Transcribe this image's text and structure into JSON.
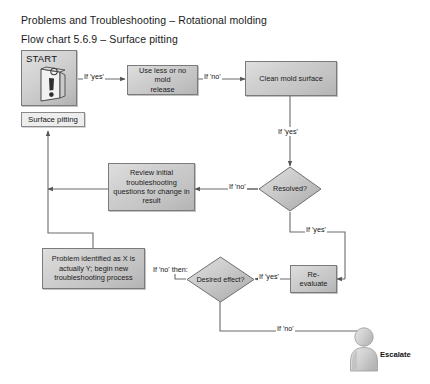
{
  "document": {
    "title_main": "Problems and Troubleshooting – Rotational molding",
    "title_sub": "Flow chart 5.6.9 – Surface pitting"
  },
  "colors": {
    "page_background": "#ffffff",
    "node_fill_light": "#dedede",
    "node_fill_dark": "#b4b4b4",
    "node_border": "#7b7b7b",
    "connector": "#6b6b6b",
    "text": "#1c1c1c",
    "label_box_fill": "#ededed"
  },
  "nodes": {
    "start": {
      "label": "START",
      "icon": "warning-document-icon",
      "shape": "start-box"
    },
    "surface_pitting": {
      "label": "Surface pitting",
      "shape": "label-box"
    },
    "use_less_release": {
      "label": "Use less or no mold release",
      "lines": [
        "Use less or no mold",
        "release"
      ],
      "shape": "process"
    },
    "clean_mold_surface": {
      "label": "Clean mold surface",
      "lines": [
        "Clean mold surface"
      ],
      "shape": "process"
    },
    "resolved": {
      "label": "Resolved?",
      "lines": [
        "Resolved?"
      ],
      "shape": "decision"
    },
    "review_initial": {
      "label": "Review initial troubleshooting questions for change in result",
      "lines": [
        "Review initial",
        "troubleshooting",
        "questions for change in",
        "result"
      ],
      "shape": "process"
    },
    "problem_identified": {
      "label": "Problem identified as X is actually Y; begin new troubleshooting process",
      "lines": [
        "Problem identified as X is",
        "actually Y; begin new",
        "troubleshooting process"
      ],
      "shape": "process"
    },
    "desired_effect": {
      "label": "Desired effect?",
      "lines": [
        "Desired",
        "effect?"
      ],
      "shape": "decision"
    },
    "re_evaluate": {
      "label": "Re-evaluate",
      "lines": [
        "Re-evaluate"
      ],
      "shape": "process"
    },
    "escalate": {
      "label": "Escalate",
      "icon": "person-icon",
      "shape": "terminator-person"
    }
  },
  "edges": [
    {
      "id": "start-to-use-less",
      "label": "If 'yes'",
      "from": "start",
      "to": "use_less_release"
    },
    {
      "id": "use-less-to-clean",
      "label": "If 'no'",
      "from": "use_less_release",
      "to": "clean_mold_surface"
    },
    {
      "id": "clean-to-resolved",
      "label": "If 'yes'",
      "from": "clean_mold_surface",
      "to": "resolved"
    },
    {
      "id": "resolved-to-review",
      "label": "If 'no'",
      "from": "resolved",
      "to": "review_initial"
    },
    {
      "id": "resolved-to-reevaluate",
      "label": "If 'yes'",
      "from": "resolved",
      "to": "re_evaluate"
    },
    {
      "id": "desired-to-problem",
      "label": "If 'no' then:",
      "from": "desired_effect",
      "to": "problem_identified"
    },
    {
      "id": "reevaluate-to-desired",
      "label": "If 'yes'",
      "from": "re_evaluate",
      "to": "desired_effect"
    },
    {
      "id": "desired-to-escalate",
      "label": "If 'no'",
      "from": "desired_effect",
      "to": "escalate"
    }
  ]
}
